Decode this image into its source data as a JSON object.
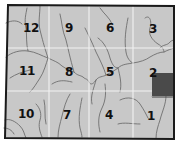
{
  "map": {
    "type": "section-grid",
    "colors": {
      "land": "#c8c8c8",
      "border": "#1a1a1a",
      "grid_lines": "#f0f0f0",
      "rivers": "#6e6e6e",
      "highlight_parcel": "#4a4a4a",
      "label": "#111111"
    },
    "grid": {
      "rows": 3,
      "cols": 4
    },
    "sections": [
      {
        "id": "12",
        "label": "12",
        "row": 0,
        "col": 0,
        "x": 36,
        "y": 28
      },
      {
        "id": "9",
        "label": "9",
        "row": 0,
        "col": 1,
        "x": 69,
        "y": 28
      },
      {
        "id": "6",
        "label": "6",
        "row": 0,
        "col": 2,
        "x": 110,
        "y": 28
      },
      {
        "id": "3",
        "label": "3",
        "row": 0,
        "col": 3,
        "x": 153,
        "y": 29
      },
      {
        "id": "11",
        "label": "11",
        "row": 1,
        "col": 0,
        "x": 28,
        "y": 71
      },
      {
        "id": "8",
        "label": "8",
        "row": 1,
        "col": 1,
        "x": 69,
        "y": 72
      },
      {
        "id": "5",
        "label": "5",
        "row": 1,
        "col": 2,
        "x": 110,
        "y": 72
      },
      {
        "id": "2",
        "label": "2",
        "row": 1,
        "col": 3,
        "x": 153,
        "y": 73
      },
      {
        "id": "10",
        "label": "10",
        "row": 2,
        "col": 0,
        "x": 27,
        "y": 114
      },
      {
        "id": "7",
        "label": "7",
        "row": 2,
        "col": 1,
        "x": 67,
        "y": 115
      },
      {
        "id": "4",
        "label": "4",
        "row": 2,
        "col": 2,
        "x": 109,
        "y": 115
      },
      {
        "id": "1",
        "label": "1",
        "row": 2,
        "col": 3,
        "x": 151,
        "y": 116
      }
    ],
    "highlighted_parcel": {
      "section": "2",
      "description": "dark shaded parcel on east edge of section 2"
    }
  }
}
